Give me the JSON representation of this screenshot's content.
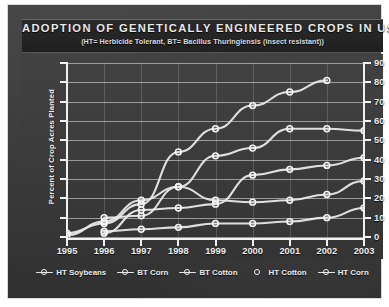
{
  "title": "Adoption of Genetically Engineered Crops in USA",
  "subtitle": "(HT= Herbicide Tolerant, BT= Bacillus Thuringiensis (insect resistant))",
  "colors": {
    "panel": "#3a3a3a",
    "board": "#3d3d3d",
    "axis": "#f2f2f2",
    "grid": "#ebebeb",
    "series_line": "#e8e8e8",
    "marker": "#f6f6f6",
    "text": "#ededed"
  },
  "legend": {
    "position": "bottom",
    "items": [
      {
        "label": "HT Soybeans",
        "marker": "open-circle",
        "line": "solid"
      },
      {
        "label": "BT Corn",
        "marker": "open-circle",
        "line": "solid"
      },
      {
        "label": "BT Cotton",
        "marker": "open-circle",
        "line": "solid"
      },
      {
        "label": "HT Cotton",
        "marker": "open-circle",
        "line": "none"
      },
      {
        "label": "HT Corn",
        "marker": "open-circle",
        "line": "solid"
      }
    ]
  },
  "chart_data": {
    "type": "line",
    "title": "Adoption of Genetically Engineered Crops in USA",
    "subtitle": "(HT= Herbicide Tolerant, BT= Bacillus Thuringiensis (insect resistant))",
    "xlabel": "",
    "ylabel": "Percent of Crop Acres Planted",
    "x": [
      1995,
      1996,
      1997,
      1998,
      1999,
      2000,
      2001,
      2002,
      2003
    ],
    "categories": [
      "1995",
      "1996",
      "1997",
      "1998",
      "1999",
      "2000",
      "2001",
      "2002",
      "2003"
    ],
    "xlim": [
      1995,
      2003
    ],
    "ylim": [
      0,
      90
    ],
    "yticks": [
      0,
      10,
      20,
      30,
      40,
      50,
      60,
      70,
      80,
      90
    ],
    "ytick_labels": [
      "0",
      "10",
      "20",
      "30",
      "40",
      "50",
      "60",
      "70",
      "80",
      "90"
    ],
    "ytick_side": "right",
    "grid": true,
    "legend_position": "bottom",
    "series": [
      {
        "name": "HT Soybeans",
        "values": [
          2,
          7,
          17,
          44,
          56,
          68,
          75,
          81,
          null
        ]
      },
      {
        "name": "BT Corn",
        "values": [
          1,
          8,
          19,
          26,
          19,
          18,
          19,
          22,
          29
        ]
      },
      {
        "name": "BT Cotton",
        "values": [
          null,
          2,
          14,
          15,
          17,
          32,
          35,
          37,
          41
        ]
      },
      {
        "name": "HT Cotton",
        "values": [
          null,
          10,
          11,
          26,
          42,
          46,
          56,
          56,
          55
        ]
      },
      {
        "name": "HT Corn",
        "values": [
          null,
          3,
          4,
          5,
          7,
          7,
          8,
          10,
          15
        ]
      }
    ]
  }
}
